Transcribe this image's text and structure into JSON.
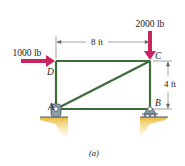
{
  "figure": {
    "caption": "(a)",
    "loads": [
      {
        "label": "1000 lb",
        "direction": "right",
        "at": "D"
      },
      {
        "label": "2000 lb",
        "direction": "down",
        "at": "C"
      }
    ],
    "joints": {
      "A": "A",
      "B": "B",
      "C": "C",
      "D": "D"
    },
    "dimensions": {
      "horizontal": "8 ft",
      "vertical": "4 ft"
    },
    "members": [
      "AD",
      "DC",
      "CB",
      "AB",
      "AC"
    ],
    "colors": {
      "member": "#3f6b3c",
      "load_arrow": "#c8245e",
      "ground": "#e8b838",
      "support": "#8a9aa8",
      "dimension": "#444444"
    }
  }
}
